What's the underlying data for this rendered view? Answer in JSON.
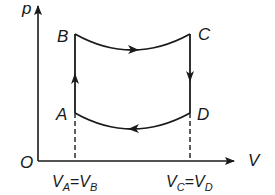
{
  "diagram": {
    "type": "p-V cycle",
    "axes": {
      "y_label": "p",
      "x_label": "V",
      "origin_label": "O"
    },
    "points": {
      "A": {
        "label": "A"
      },
      "B": {
        "label": "B"
      },
      "C": {
        "label": "C"
      },
      "D": {
        "label": "D"
      }
    },
    "x_ticks": [
      {
        "label_main": "V",
        "sub1": "A",
        "eq": "=",
        "label2": "V",
        "sub2": "B"
      },
      {
        "label_main": "V",
        "sub1": "C",
        "eq": "=",
        "label2": "V",
        "sub2": "D"
      }
    ],
    "processes": [
      {
        "from": "A",
        "to": "B",
        "kind": "isochoric increase in pressure"
      },
      {
        "from": "B",
        "to": "C",
        "kind": "curved expansion"
      },
      {
        "from": "C",
        "to": "D",
        "kind": "isochoric decrease in pressure"
      },
      {
        "from": "D",
        "to": "A",
        "kind": "curved compression"
      }
    ],
    "colors": {
      "line": "#1a1a1a",
      "background": "#ffffff"
    }
  }
}
